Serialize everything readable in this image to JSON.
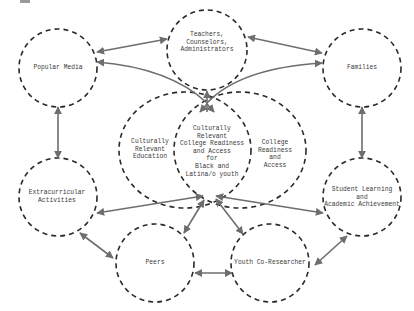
{
  "diagram": {
    "type": "concept-map",
    "colors": {
      "node_stroke": "#2a2a2a",
      "edge_stroke": "#6e6e6e",
      "text": "#3a3a3a",
      "background": "#ffffff"
    },
    "nodes": {
      "popular_media": {
        "label": "Popular Media"
      },
      "teachers": {
        "label": "Teachers,\nCounselors,\nAdministrators"
      },
      "families": {
        "label": "Families"
      },
      "culturally_relevant_education": {
        "label": "Culturally\nRelevant\nEducation"
      },
      "core": {
        "label": "Culturally\nRelevant\nCollege Readiness\nand Access\nfor\nBlack and\nLatina/o youth"
      },
      "college_readiness": {
        "label": "College\nReadiness\nand\nAccess"
      },
      "extracurricular": {
        "label": "Extracurricular\nActivities"
      },
      "student_learning": {
        "label": "Student Learning\nand\nAcademic Achievement"
      },
      "peers": {
        "label": "Peers"
      },
      "youth_co_researcher": {
        "label": "Youth Co-Researcher"
      }
    },
    "edges": [
      {
        "from": "popular_media",
        "to": "teachers",
        "direction": "both"
      },
      {
        "from": "teachers",
        "to": "families",
        "direction": "both"
      },
      {
        "from": "popular_media",
        "to": "extracurricular",
        "direction": "both"
      },
      {
        "from": "families",
        "to": "student_learning",
        "direction": "both"
      },
      {
        "from": "core",
        "to": "popular_media",
        "direction": "to"
      },
      {
        "from": "core",
        "to": "families",
        "direction": "to"
      },
      {
        "from": "core",
        "to": "teachers",
        "direction": "to"
      },
      {
        "from": "extracurricular",
        "to": "core",
        "direction": "both"
      },
      {
        "from": "student_learning",
        "to": "core",
        "direction": "both"
      },
      {
        "from": "peers",
        "to": "core",
        "direction": "both"
      },
      {
        "from": "youth_co_researcher",
        "to": "core",
        "direction": "both"
      },
      {
        "from": "extracurricular",
        "to": "peers",
        "direction": "both"
      },
      {
        "from": "peers",
        "to": "youth_co_researcher",
        "direction": "both"
      },
      {
        "from": "youth_co_researcher",
        "to": "student_learning",
        "direction": "both"
      }
    ]
  }
}
